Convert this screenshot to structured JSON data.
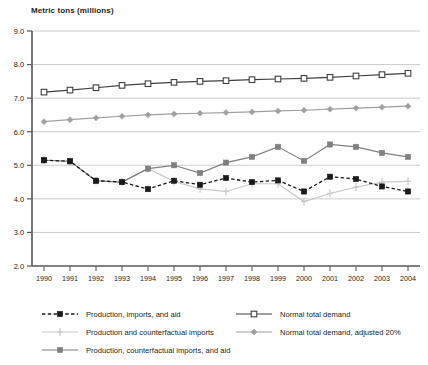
{
  "chart_data": {
    "type": "line",
    "title": "Metric tons (millions)",
    "xlabel": "",
    "ylabel": "Metric tons (millions)",
    "ylim": [
      2.0,
      9.0
    ],
    "ytick_step": 1.0,
    "yticks": [
      "2.0",
      "3.0",
      "4.0",
      "5.0",
      "6.0",
      "7.0",
      "8.0",
      "9.0"
    ],
    "grid": true,
    "grid_axis": "y",
    "legend_position": "bottom",
    "legend_columns": 2,
    "categories": [
      "1990",
      "1991",
      "1992",
      "1993",
      "1994",
      "1995",
      "1996",
      "1997",
      "1998",
      "1999",
      "2000",
      "2001",
      "2002",
      "2003",
      "2004"
    ],
    "series": [
      {
        "name": "Production, imports, and aid",
        "color": "#1a1a1a",
        "line_style": "dashed",
        "marker": "filled-square",
        "values": [
          5.15,
          5.12,
          4.54,
          4.5,
          4.29,
          4.54,
          4.42,
          4.62,
          4.5,
          4.55,
          4.22,
          4.66,
          4.59,
          4.37,
          4.22
        ]
      },
      {
        "name": "Production and counterfactual imports",
        "color": "#c9c9c9",
        "line_style": "solid",
        "marker": "plus",
        "values": [
          5.15,
          5.12,
          4.54,
          4.5,
          4.9,
          4.52,
          4.3,
          4.22,
          4.45,
          4.45,
          3.92,
          4.16,
          4.35,
          4.5,
          4.52
        ]
      },
      {
        "name": "Production, counterfactual imports, and aid",
        "color": "#808080",
        "line_style": "solid",
        "marker": "filled-square",
        "values": [
          5.15,
          5.12,
          4.54,
          4.5,
          4.9,
          5.0,
          4.77,
          5.08,
          5.25,
          5.55,
          5.13,
          5.62,
          5.55,
          5.37,
          5.25
        ]
      },
      {
        "name": "Normal total demand",
        "color": "#404040",
        "line_style": "solid",
        "marker": "open-square",
        "values": [
          7.18,
          7.24,
          7.31,
          7.38,
          7.43,
          7.47,
          7.5,
          7.52,
          7.55,
          7.57,
          7.59,
          7.62,
          7.66,
          7.7,
          7.74
        ]
      },
      {
        "name": "Normal total demand, adjusted 20%",
        "color": "#a0a0a0",
        "line_style": "solid",
        "marker": "diamond",
        "values": [
          6.3,
          6.36,
          6.41,
          6.46,
          6.5,
          6.53,
          6.55,
          6.57,
          6.59,
          6.62,
          6.64,
          6.67,
          6.7,
          6.73,
          6.76
        ]
      }
    ]
  }
}
